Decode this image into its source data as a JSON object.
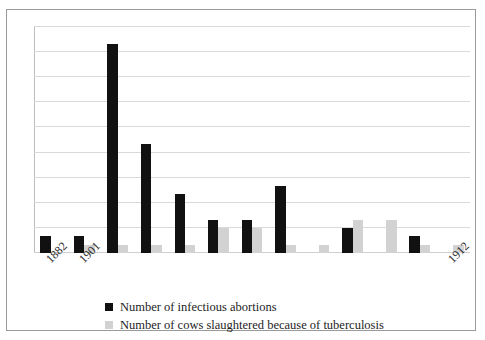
{
  "chart_data": {
    "type": "bar",
    "title": "",
    "subtitle": "",
    "xlabel": "",
    "ylabel": "",
    "ylim": [
      0,
      27
    ],
    "yticks": [
      0,
      3,
      6,
      9,
      12,
      15,
      18,
      21,
      24,
      27
    ],
    "ytick_labels": [
      "0",
      "3",
      "6",
      "9",
      "12",
      "15",
      "18",
      "21",
      "24",
      "27"
    ],
    "ytick_labels_visible": [
      "0",
      "3",
      "6",
      "9",
      "2",
      "5",
      "8",
      "1",
      "4",
      "7"
    ],
    "grid": true,
    "grid_axis": "y",
    "legend_position": "bottom",
    "categories": [
      "1882",
      "1901",
      "1902",
      "1903",
      "1904",
      "1905",
      "1906",
      "1907",
      "1908",
      "1909",
      "1910",
      "1911",
      "1912"
    ],
    "xtick_labels_shown": [
      "1882",
      "1901",
      "1912"
    ],
    "series": [
      {
        "name": "Number of infectious abortions",
        "color": "#111111",
        "values": [
          2,
          2,
          25,
          13,
          7,
          4,
          4,
          8,
          0,
          3,
          0,
          2,
          0
        ]
      },
      {
        "name": "Number of cows slaughtered because of tuberculosis",
        "color": "#d2d2d2",
        "values": [
          0,
          1,
          1,
          1,
          1,
          3,
          3,
          1,
          1,
          4,
          4,
          1,
          1
        ]
      }
    ]
  },
  "legend": {
    "items": [
      {
        "label": "Number of infectious abortions",
        "color": "#111111"
      },
      {
        "label": "Number of cows slaughtered because of tuberculosis",
        "color": "#d2d2d2"
      }
    ]
  },
  "axis": {
    "x_labels": [
      {
        "text": "1882",
        "index": 0
      },
      {
        "text": "1901",
        "index": 1
      },
      {
        "text": "1912",
        "index": 12
      }
    ]
  }
}
